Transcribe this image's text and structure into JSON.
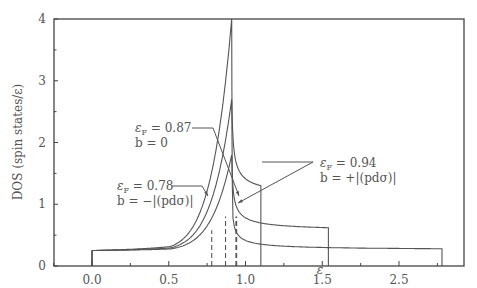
{
  "chart_data": {
    "type": "line",
    "title": "",
    "xlabel": "ε",
    "ylabel": "DOS (spin states/ε)",
    "xlim": [
      -0.25,
      2.43
    ],
    "ylim": [
      0,
      4
    ],
    "x_ticks": [
      {
        "value": 0.0,
        "label": "0.0"
      },
      {
        "value": 0.5,
        "label": "0.5"
      },
      {
        "value": 1.0,
        "label": "1.0"
      },
      {
        "value": 1.5,
        "label": "1.5"
      },
      {
        "value": 2.0,
        "label": "2.5"
      }
    ],
    "y_ticks": [
      {
        "value": 0,
        "label": "0"
      },
      {
        "value": 1,
        "label": "1"
      },
      {
        "value": 2,
        "label": "2"
      },
      {
        "value": 3,
        "label": "3"
      },
      {
        "value": 4,
        "label": "4"
      }
    ],
    "grid": false,
    "legend": "none (inline annotations)",
    "series": [
      {
        "name": "b = -|(pdσ)|",
        "eF": 0.78,
        "band_min": 0.0,
        "band_max": 1.1,
        "peak_x": 0.91,
        "peak_y": 4.0,
        "x": [
          0.0,
          0.2,
          0.4,
          0.6,
          0.75,
          0.85,
          0.91,
          0.97,
          1.05,
          1.1
        ],
        "y": [
          0.25,
          0.32,
          0.45,
          0.7,
          1.1,
          1.8,
          4.0,
          1.9,
          1.45,
          1.3
        ]
      },
      {
        "name": "b = 0",
        "eF": 0.87,
        "band_min": 0.0,
        "band_max": 1.54,
        "peak_x": 0.91,
        "peak_y": 2.7,
        "x": [
          0.0,
          0.2,
          0.4,
          0.6,
          0.75,
          0.85,
          0.91,
          0.97,
          1.1,
          1.3,
          1.54
        ],
        "y": [
          0.25,
          0.3,
          0.38,
          0.55,
          0.8,
          1.2,
          2.7,
          1.3,
          0.9,
          0.72,
          0.62
        ]
      },
      {
        "name": "b = +|(pdσ)|",
        "eF": 0.94,
        "band_min": 0.0,
        "band_max": 2.28,
        "peak_x": 0.91,
        "peak_y": 1.8,
        "x": [
          0.0,
          0.2,
          0.4,
          0.6,
          0.75,
          0.85,
          0.91,
          0.97,
          1.2,
          1.6,
          2.0,
          2.28
        ],
        "y": [
          0.25,
          0.28,
          0.34,
          0.45,
          0.62,
          0.9,
          1.8,
          0.95,
          0.6,
          0.42,
          0.33,
          0.28
        ]
      }
    ],
    "fermi_levels": [
      {
        "value": 0.78,
        "style": "dashed"
      },
      {
        "value": 0.87,
        "style": "dashed"
      },
      {
        "value": 0.94,
        "style": "dashed-bold"
      }
    ],
    "annotations": [
      {
        "line1": "ε",
        "sub": "F",
        "eq": " = 0.87",
        "line2": "b = 0"
      },
      {
        "line1": "ε",
        "sub": "F",
        "eq": " = 0.78",
        "line2": "b = −|(pdσ)|"
      },
      {
        "line1": "ε",
        "sub": "F",
        "eq": " = 0.94",
        "line2": "b = +|(pdσ)|"
      }
    ]
  },
  "colors": {
    "axis": "#444444",
    "curve": "#555555",
    "text": "#555555"
  }
}
